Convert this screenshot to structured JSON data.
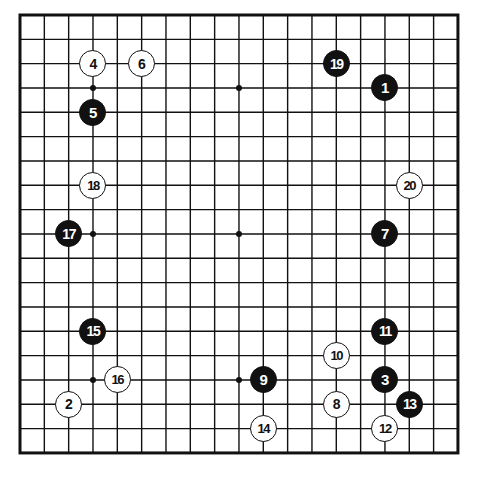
{
  "figure": {
    "kind": "go-board-diagram",
    "board_size": 19,
    "colors": {
      "background": "#ffffff",
      "grid_line": "#111111",
      "border_line": "#111111",
      "black_stone": "#111111",
      "white_stone": "#ffffff",
      "black_stone_label": "#ffffff",
      "white_stone_label": "#111111"
    },
    "geometry": {
      "origin_x": 20,
      "origin_y": 15,
      "spacing": 24.33,
      "stone_diameter": 27,
      "border_width": 3,
      "grid_width": 1.4,
      "star_point_radius": 3
    },
    "star_points": [
      {
        "col": 3,
        "row": 3
      },
      {
        "col": 9,
        "row": 3
      },
      {
        "col": 15,
        "row": 3
      },
      {
        "col": 3,
        "row": 9
      },
      {
        "col": 9,
        "row": 9
      },
      {
        "col": 15,
        "row": 9
      },
      {
        "col": 3,
        "row": 15
      },
      {
        "col": 9,
        "row": 15
      },
      {
        "col": 15,
        "row": 15
      }
    ],
    "moves": [
      {
        "number": "1",
        "color": "black",
        "col": 15,
        "row": 3
      },
      {
        "number": "2",
        "color": "white",
        "col": 2,
        "row": 16
      },
      {
        "number": "3",
        "color": "black",
        "col": 15,
        "row": 15
      },
      {
        "number": "4",
        "color": "white",
        "col": 3,
        "row": 2
      },
      {
        "number": "5",
        "color": "black",
        "col": 3,
        "row": 4
      },
      {
        "number": "6",
        "color": "white",
        "col": 5,
        "row": 2
      },
      {
        "number": "7",
        "color": "black",
        "col": 15,
        "row": 9
      },
      {
        "number": "8",
        "color": "white",
        "col": 13,
        "row": 16
      },
      {
        "number": "9",
        "color": "black",
        "col": 10,
        "row": 15
      },
      {
        "number": "10",
        "color": "white",
        "col": 13,
        "row": 14
      },
      {
        "number": "11",
        "color": "black",
        "col": 15,
        "row": 13
      },
      {
        "number": "12",
        "color": "white",
        "col": 15,
        "row": 17
      },
      {
        "number": "13",
        "color": "black",
        "col": 16,
        "row": 16
      },
      {
        "number": "14",
        "color": "white",
        "col": 10,
        "row": 17
      },
      {
        "number": "15",
        "color": "black",
        "col": 3,
        "row": 13
      },
      {
        "number": "16",
        "color": "white",
        "col": 4,
        "row": 15
      },
      {
        "number": "17",
        "color": "black",
        "col": 2,
        "row": 9
      },
      {
        "number": "18",
        "color": "white",
        "col": 3,
        "row": 7
      },
      {
        "number": "19",
        "color": "black",
        "col": 13,
        "row": 2
      },
      {
        "number": "20",
        "color": "white",
        "col": 16,
        "row": 7
      }
    ]
  }
}
